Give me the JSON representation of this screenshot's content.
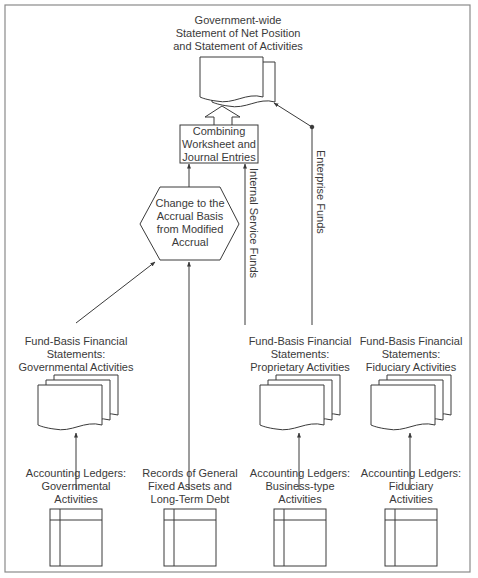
{
  "diagram": {
    "colors": {
      "stroke": "#3a3a3a",
      "frame": "#8a8a8a",
      "text": "#3a3a3a",
      "background": "#ffffff"
    },
    "nodes": {
      "gov_wide": {
        "lines": [
          "Government-wide",
          "Statement of Net Position",
          "and Statement of Activities"
        ],
        "icon": "document-icon"
      },
      "combining": {
        "lines": [
          "Combining",
          "Worksheet and",
          "Journal Entries"
        ],
        "shape": "rectangle"
      },
      "accrual_change": {
        "lines": [
          "Change to the",
          "Accrual Basis",
          "from Modified",
          "Accrual"
        ],
        "shape": "hexagon"
      },
      "fund_governmental": {
        "lines": [
          "Fund-Basis Financial",
          "Statements:",
          "Governmental Activities"
        ],
        "icon": "stacked-documents-icon"
      },
      "fund_proprietary": {
        "lines": [
          "Fund-Basis Financial",
          "Statements:",
          "Proprietary Activities"
        ],
        "icon": "stacked-documents-icon"
      },
      "fund_fiduciary": {
        "lines": [
          "Fund-Basis Financial",
          "Statements:",
          "Fiduciary Activities"
        ],
        "icon": "stacked-documents-icon"
      },
      "ledger_governmental": {
        "lines": [
          "Accounting Ledgers:",
          "Governmental",
          "Activities"
        ],
        "icon": "ledger-icon"
      },
      "records_general": {
        "lines": [
          "Records of General",
          "Fixed Assets and",
          "Long-Term Debt"
        ],
        "icon": "ledger-icon"
      },
      "ledger_business": {
        "lines": [
          "Accounting Ledgers:",
          "Business-type",
          "Activities"
        ],
        "icon": "ledger-icon"
      },
      "ledger_fiduciary": {
        "lines": [
          "Accounting Ledgers:",
          "Fiduciary",
          "Activities"
        ],
        "icon": "ledger-icon"
      }
    },
    "edge_labels": {
      "internal_service": "Internal Service Funds",
      "enterprise": "Enterprise Funds"
    },
    "edges": [
      {
        "from": "ledger_governmental",
        "to": "fund_governmental"
      },
      {
        "from": "ledger_business",
        "to": "fund_proprietary"
      },
      {
        "from": "ledger_fiduciary",
        "to": "fund_fiduciary"
      },
      {
        "from": "fund_governmental",
        "to": "accrual_change"
      },
      {
        "from": "records_general",
        "to": "accrual_change"
      },
      {
        "from": "accrual_change",
        "to": "combining"
      },
      {
        "from": "fund_proprietary",
        "to": "combining",
        "label": "Internal Service Funds"
      },
      {
        "from": "fund_proprietary",
        "to": "gov_wide",
        "label": "Enterprise Funds"
      },
      {
        "from": "combining",
        "to": "gov_wide",
        "style": "hollow-arrow"
      }
    ]
  }
}
